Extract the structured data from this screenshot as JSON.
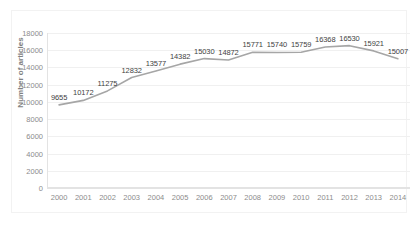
{
  "chart_data": {
    "type": "line",
    "title": "",
    "xlabel": "",
    "ylabel": "Number of articles",
    "categories": [
      "2000",
      "2001",
      "2002",
      "2003",
      "2004",
      "2005",
      "2006",
      "2007",
      "2008",
      "2009",
      "2010",
      "2011",
      "2012",
      "2013",
      "2014"
    ],
    "values": [
      9655,
      10172,
      11275,
      12832,
      13577,
      14382,
      15030,
      14872,
      15771,
      15740,
      15759,
      16368,
      16530,
      15921,
      15007
    ],
    "data_labels": [
      "9655",
      "10172",
      "11275",
      "12832",
      "13577",
      "14382",
      "15030",
      "14872",
      "15771",
      "15740",
      "15759",
      "16368",
      "16530",
      "15921",
      "15007"
    ],
    "ylim": [
      0,
      18000
    ],
    "y_ticks": [
      0,
      2000,
      4000,
      6000,
      8000,
      10000,
      12000,
      14000,
      16000,
      18000
    ],
    "y_tick_labels": [
      "0",
      "2000",
      "4000",
      "6000",
      "8000",
      "10000",
      "12000",
      "14000",
      "16000",
      "18000"
    ],
    "grid": true,
    "legend": "none",
    "series": [
      {
        "name": "Number of articles",
        "color": "#a6a6a6",
        "values": [
          9655,
          10172,
          11275,
          12832,
          13577,
          14382,
          15030,
          14872,
          15771,
          15740,
          15759,
          16368,
          16530,
          15921,
          15007
        ]
      }
    ]
  },
  "style": {
    "line_color": "#a6a6a6",
    "grid_color": "#f0f0f0",
    "axis_color": "#e3e3e3",
    "tick_text_color": "#8c8c8c",
    "data_label_color": "#3f3f3f",
    "background": "#ffffff"
  }
}
